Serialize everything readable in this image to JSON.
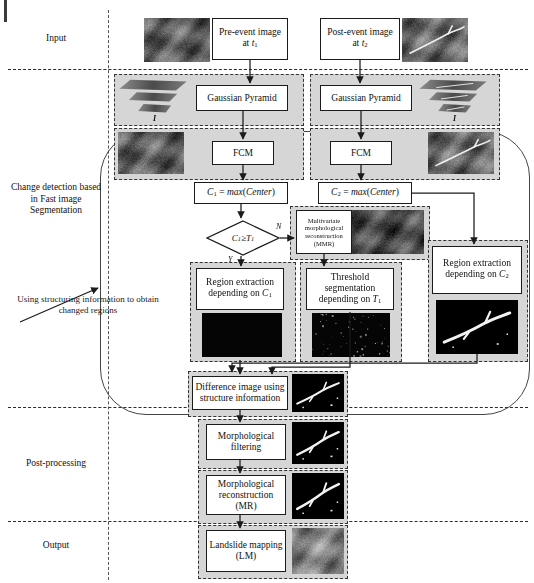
{
  "figure": {
    "type": "flowchart",
    "stages": [
      {
        "id": "input",
        "label": "Input"
      },
      {
        "id": "change-detection",
        "label": "Change detection based in Fast image Segmentation"
      },
      {
        "id": "post-processing",
        "label": "Post-processing"
      },
      {
        "id": "output",
        "label": "Output"
      }
    ],
    "annotation": "Using structuring information to obtain changed regions",
    "nodes": {
      "pre_event": {
        "label": "Pre-event image at t₁"
      },
      "post_event": {
        "label": "Post-event image at t₂"
      },
      "gaussian_left": {
        "label": "Gaussian Pyramid"
      },
      "gaussian_right": {
        "label": "Gaussian Pyramid"
      },
      "fcm_left": {
        "label": "FCM"
      },
      "fcm_right": {
        "label": "FCM"
      },
      "c1": {
        "label": "C₁ = max(Center)"
      },
      "c2": {
        "label": "C₂ = max(Center)"
      },
      "decision": {
        "label": "C₁≥T₁",
        "yes": "Y",
        "no": "N"
      },
      "mmr": {
        "label": "Multivariate morphological reconstruction (MMR)"
      },
      "region_c1": {
        "label": "Region extraction depending on C₁"
      },
      "threshold_t1": {
        "label": "Threshold segmentation depending on T₁"
      },
      "region_c2": {
        "label": "Region extraction depending on C₂"
      },
      "difference": {
        "label": "Difference image using structure information"
      },
      "morph_filter": {
        "label": "Morphological filtering"
      },
      "morph_recon": {
        "label": "Morphological reconstruction (MR)"
      },
      "landslide_map": {
        "label": "Landslide mapping (LM)"
      }
    },
    "pyramid_marker": "I",
    "colors": {
      "panel_fill": "#d6d6d6",
      "panel_border": "#333333",
      "box_border": "#1b1b1b",
      "separator": "#2b2b2b",
      "container_border": "#444444",
      "text": "#111111"
    }
  }
}
